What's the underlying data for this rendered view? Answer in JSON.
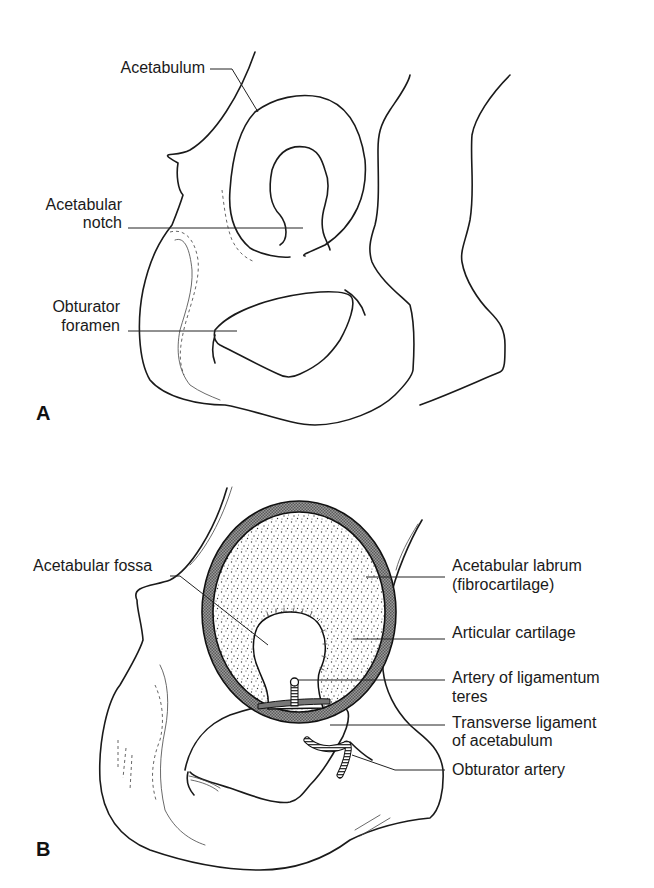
{
  "figure": {
    "panel_a": {
      "panel_label": "A",
      "labels": {
        "acetabulum": "Acetabulum",
        "acetabular_notch_line1": "Acetabular",
        "acetabular_notch_line2": "notch",
        "obturator_foramen_line1": "Obturator",
        "obturator_foramen_line2": "foramen"
      }
    },
    "panel_b": {
      "panel_label": "B",
      "labels": {
        "acetabular_fossa": "Acetabular fossa",
        "acetabular_labrum_line1": "Acetabular labrum",
        "acetabular_labrum_line2": "(fibrocartilage)",
        "articular_cartilage": "Articular cartilage",
        "artery_ligamentum_teres_line1": "Artery of ligamentum",
        "artery_ligamentum_teres_line2": "teres",
        "transverse_ligament_line1": "Transverse ligament",
        "transverse_ligament_line2": "of acetabulum",
        "obturator_artery": "Obturator artery"
      }
    }
  }
}
